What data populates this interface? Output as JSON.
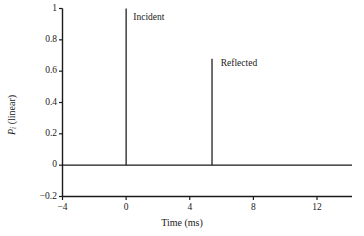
{
  "chart_data": {
    "type": "line",
    "title": "",
    "xlabel": "Time (ms)",
    "ylabel": "P_i (linear)",
    "ylabel_main": "P",
    "ylabel_sub": "i",
    "ylabel_paren": " (linear)",
    "xlim": [
      -4,
      14.2
    ],
    "ylim": [
      -0.2,
      1.0
    ],
    "xticks": [
      -4,
      0,
      4,
      8,
      12
    ],
    "xtick_labels": [
      "-4",
      "0",
      "4",
      "8",
      "12"
    ],
    "yticks": [
      -0.2,
      0,
      0.2,
      0.4,
      0.6,
      0.8,
      1
    ],
    "ytick_labels": [
      "-0.2",
      "0",
      "0.2",
      "0.4",
      "0.6",
      "0.8",
      "1"
    ],
    "grid": false,
    "legend": "none",
    "line_color": "#1a1a1a",
    "background": "#ffffff",
    "series": [
      {
        "name": "pulse-response",
        "description": "Baseline at zero with two narrow impulses",
        "x": [
          -4,
          0,
          0,
          0,
          5.4,
          5.4,
          5.4,
          14.2
        ],
        "values": [
          0,
          0,
          1.0,
          0,
          0,
          0.68,
          0,
          0
        ]
      }
    ],
    "annotations": [
      {
        "name": "incident",
        "label": "Incident",
        "x": 0,
        "peak": 1.0,
        "label_x_ms": 0.45,
        "label_y_val": 0.94
      },
      {
        "name": "reflected",
        "label": "Reflected",
        "x": 5.4,
        "peak": 0.68,
        "label_x_ms": 5.95,
        "label_y_val": 0.645
      }
    ],
    "ringing": {
      "center_x_ms": 5.4,
      "amplitude_max": 0.05,
      "amplitude_min": -0.05,
      "span_ms": 1.9
    }
  }
}
